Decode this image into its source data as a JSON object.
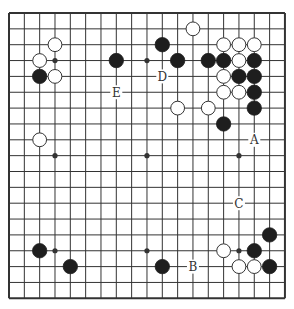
{
  "board": {
    "size": 19,
    "origin": {
      "x": 9,
      "y": 13
    },
    "spacing": {
      "x": 15.33,
      "y": 15.85
    },
    "colors": {
      "line": "#333333",
      "black_stone": "#1e1e1e",
      "white_stone": "#ffffff",
      "stone_outline": "#333333",
      "background": "#ffffff"
    },
    "star_points": [
      [
        3,
        3
      ],
      [
        9,
        3
      ],
      [
        15,
        3
      ],
      [
        3,
        9
      ],
      [
        9,
        9
      ],
      [
        15,
        9
      ],
      [
        3,
        15
      ],
      [
        9,
        15
      ],
      [
        15,
        15
      ]
    ],
    "black_stones": [
      [
        2,
        4
      ],
      [
        7,
        3
      ],
      [
        10,
        2
      ],
      [
        11,
        3
      ],
      [
        13,
        3
      ],
      [
        14,
        3
      ],
      [
        16,
        3
      ],
      [
        15,
        4
      ],
      [
        16,
        4
      ],
      [
        16,
        5
      ],
      [
        16,
        6
      ],
      [
        14,
        7
      ],
      [
        17,
        14
      ],
      [
        16,
        15
      ],
      [
        17,
        16
      ],
      [
        2,
        15
      ],
      [
        4,
        16
      ],
      [
        10,
        16
      ]
    ],
    "white_stones": [
      [
        12,
        1
      ],
      [
        3,
        2
      ],
      [
        2,
        3
      ],
      [
        3,
        4
      ],
      [
        14,
        2
      ],
      [
        15,
        2
      ],
      [
        16,
        2
      ],
      [
        15,
        3
      ],
      [
        14,
        4
      ],
      [
        14,
        5
      ],
      [
        15,
        5
      ],
      [
        11,
        6
      ],
      [
        13,
        6
      ],
      [
        2,
        8
      ],
      [
        14,
        15
      ],
      [
        15,
        16
      ],
      [
        16,
        16
      ]
    ],
    "labels": [
      {
        "text": "D",
        "col": 10,
        "row": 4
      },
      {
        "text": "E",
        "col": 7,
        "row": 5
      },
      {
        "text": "A",
        "col": 16,
        "row": 8
      },
      {
        "text": "C",
        "col": 15,
        "row": 12
      },
      {
        "text": "B",
        "col": 12,
        "row": 16
      }
    ]
  }
}
